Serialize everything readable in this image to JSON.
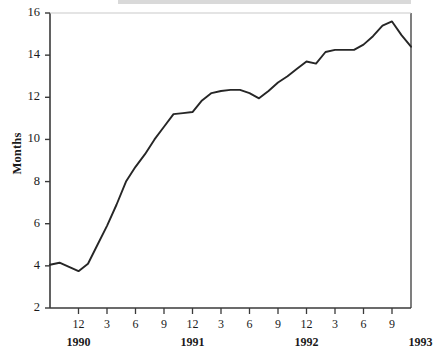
{
  "chart_data": {
    "type": "line",
    "title": "",
    "subtitle": "",
    "xlabel": "",
    "ylabel": "Months",
    "ylim": [
      2,
      16
    ],
    "ytick_labels": [
      "2",
      "4",
      "6",
      "8",
      "10",
      "12",
      "14",
      "16"
    ],
    "ytick_values": [
      2,
      4,
      6,
      8,
      10,
      12,
      14,
      16
    ],
    "grid": false,
    "legend": false,
    "legend_position": "none",
    "x_month_tick_labels": [
      "12",
      "3",
      "6",
      "9",
      "12",
      "3",
      "6",
      "9",
      "12",
      "3",
      "6",
      "9"
    ],
    "x_month_tick_x": [
      12,
      15,
      18,
      21,
      24,
      27,
      30,
      33,
      36,
      39,
      42,
      45
    ],
    "x_year_labels": [
      "1990",
      "1991",
      "1992",
      "1993"
    ],
    "x_year_tick_x": [
      12,
      24,
      36,
      48
    ],
    "x_range": [
      9,
      47
    ],
    "series": [
      {
        "name": "Months",
        "color": "#262626",
        "x": [
          9,
          10,
          11,
          12,
          13,
          14,
          15,
          16,
          17,
          18,
          19,
          20,
          21,
          22,
          23,
          24,
          25,
          26,
          27,
          28,
          29,
          30,
          31,
          32,
          33,
          34,
          35,
          36,
          37,
          38,
          39,
          40,
          41,
          42,
          43,
          44,
          45,
          46,
          47
        ],
        "values": [
          4.05,
          4.15,
          3.95,
          3.75,
          4.1,
          5.0,
          5.9,
          6.9,
          8.0,
          8.7,
          9.3,
          10.0,
          10.6,
          11.2,
          11.25,
          11.3,
          11.85,
          12.2,
          12.3,
          12.35,
          12.35,
          12.2,
          11.95,
          12.3,
          12.7,
          13.0,
          13.35,
          13.7,
          13.6,
          14.15,
          14.25,
          14.25,
          14.25,
          14.5,
          14.9,
          15.4,
          15.6,
          14.95,
          14.4
        ]
      }
    ],
    "axis_color": "#3a3a3a",
    "line_color": "#262626",
    "background": "#ffffff"
  },
  "figure": {
    "plot_left_px": 50,
    "plot_right_px": 411,
    "plot_top_px": 13,
    "plot_bottom_px": 308
  }
}
